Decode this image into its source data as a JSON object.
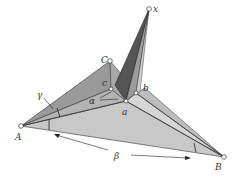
{
  "diagram": {
    "type": "3D geometric figure (polyhedral angles / solid angle construction)",
    "points": {
      "x": {
        "label": "x",
        "pos": [
          149,
          9
        ]
      },
      "C": {
        "label": "C",
        "pos": [
          110,
          61
        ]
      },
      "c": {
        "label": "c",
        "pos": [
          111,
          89
        ]
      },
      "a": {
        "label": "a",
        "pos": [
          126,
          101
        ]
      },
      "b": {
        "label": "b",
        "pos": [
          136,
          93
        ]
      },
      "A": {
        "label": "A",
        "pos": [
          21,
          126
        ]
      },
      "B": {
        "label": "B",
        "pos": [
          224,
          157
        ]
      }
    },
    "angle_labels": {
      "alpha": "α",
      "beta": "β",
      "gamma": "γ"
    },
    "colors": {
      "dark_face": "#5a5a5a",
      "mid_face": "#9a9a9a",
      "light_face": "#c4c4c4",
      "lighter_face": "#d8d8d8",
      "edge": "#333333"
    }
  }
}
